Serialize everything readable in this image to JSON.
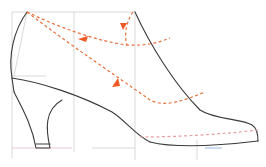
{
  "diagram": {
    "type": "shoe-pattern",
    "colors": {
      "outline": "#3a3a3a",
      "grid": "#cfcfcf",
      "guide_dashed": "#e8703a",
      "arrow": "#ee5a24",
      "ground_pink": "#e8b8c8",
      "ground_blue": "#9bb4e0"
    },
    "elements": [
      {
        "name": "construction-grid",
        "kind": "grid-lines"
      },
      {
        "name": "heel-back-curve",
        "kind": "solid-outline"
      },
      {
        "name": "heel",
        "kind": "solid-outline"
      },
      {
        "name": "vamp-topline",
        "kind": "solid-outline"
      },
      {
        "name": "toe-and-sole",
        "kind": "solid-outline"
      },
      {
        "name": "upper-guide-arc",
        "kind": "dashed-arrow",
        "direction": "toward heel"
      },
      {
        "name": "lower-guide-arc",
        "kind": "dashed-arrow",
        "direction": "toward heel"
      },
      {
        "name": "instep-drop-arc",
        "kind": "dashed-arrow",
        "direction": "downward"
      },
      {
        "name": "sole-dashed-line",
        "kind": "dashed"
      }
    ]
  }
}
